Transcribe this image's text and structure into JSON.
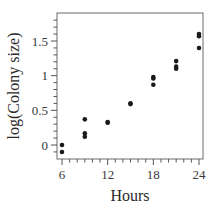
{
  "chart_data": {
    "type": "scatter",
    "title": "",
    "xlabel": "Hours",
    "ylabel": "log(Colony size)",
    "xlim": [
      5.3,
      24.6
    ],
    "ylim": [
      -0.2,
      1.9
    ],
    "x_ticks": [
      6,
      12,
      18,
      24
    ],
    "x_tick_labels": [
      "6",
      "12",
      "18",
      "24"
    ],
    "y_ticks": [
      0,
      0.5,
      1,
      1.5
    ],
    "y_tick_labels": [
      "0",
      "0.5",
      "1",
      "1.5"
    ],
    "x_minor_step": 1,
    "y_minor_step": 0.1,
    "grid": false,
    "legend": null,
    "series": [
      {
        "name": "Colony growth",
        "color": "#1a1a1a",
        "points": [
          {
            "x": 6,
            "y": 0.0
          },
          {
            "x": 6,
            "y": -0.1
          },
          {
            "x": 9,
            "y": 0.37
          },
          {
            "x": 9,
            "y": 0.17
          },
          {
            "x": 9,
            "y": 0.12
          },
          {
            "x": 12,
            "y": 0.33
          },
          {
            "x": 12,
            "y": 0.32
          },
          {
            "x": 15,
            "y": 0.6
          },
          {
            "x": 15,
            "y": 0.59
          },
          {
            "x": 18,
            "y": 0.98
          },
          {
            "x": 18,
            "y": 0.96
          },
          {
            "x": 18,
            "y": 0.87
          },
          {
            "x": 21,
            "y": 1.21
          },
          {
            "x": 21,
            "y": 1.13
          },
          {
            "x": 21,
            "y": 1.1
          },
          {
            "x": 24,
            "y": 1.6
          },
          {
            "x": 24,
            "y": 1.57
          },
          {
            "x": 24,
            "y": 1.4
          }
        ]
      }
    ]
  }
}
